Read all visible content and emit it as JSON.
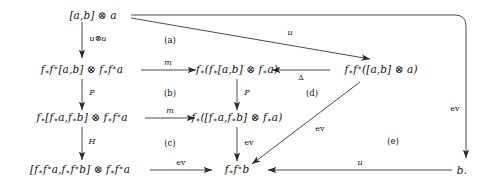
{
  "diagram": {
    "nodes": [
      {
        "id": "n-top",
        "label": "[a,b] ⊗ a"
      },
      {
        "id": "n-r2-left",
        "label": "f∗f∗[a,b] ⊗ f∗f∗a"
      },
      {
        "id": "n-r2-mid",
        "label": "f∗(f∗[a,b] ⊗ f∗a)"
      },
      {
        "id": "n-r2-right",
        "label": "f∗f∗([a,b] ⊗ a)"
      },
      {
        "id": "n-r3-left",
        "label": "f∗[f∗a,f∗b] ⊗ f∗f∗a"
      },
      {
        "id": "n-r3-mid",
        "label": "f∗([f∗a,f∗b] ⊗ f∗a)"
      },
      {
        "id": "n-r4-left",
        "label": "[f∗f∗a,f∗f∗b] ⊗ f∗f∗a"
      },
      {
        "id": "n-r4-mid",
        "label": "f∗f∗b"
      },
      {
        "id": "n-r4-right",
        "label": "b."
      }
    ],
    "arrow_labels": [
      {
        "id": "lbl-uou",
        "text": "u⊗u"
      },
      {
        "id": "lbl-u-diag",
        "text": "u"
      },
      {
        "id": "lbl-m-r2",
        "text": "m"
      },
      {
        "id": "lbl-delta",
        "text": "Δ"
      },
      {
        "id": "lbl-p-left",
        "text": "P"
      },
      {
        "id": "lbl-p-mid",
        "text": "P"
      },
      {
        "id": "lbl-m-r3",
        "text": "m"
      },
      {
        "id": "lbl-h",
        "text": "H"
      },
      {
        "id": "lbl-ev-mid",
        "text": "ev"
      },
      {
        "id": "lbl-ev-diag",
        "text": "ev"
      },
      {
        "id": "lbl-ev-bot",
        "text": "ev"
      },
      {
        "id": "lbl-ev-right",
        "text": "ev"
      },
      {
        "id": "lbl-u-bot",
        "text": "u"
      }
    ],
    "region_labels": [
      {
        "id": "reg-a",
        "text": "(a)"
      },
      {
        "id": "reg-b",
        "text": "(b)"
      },
      {
        "id": "reg-c",
        "text": "(c)"
      },
      {
        "id": "reg-d",
        "text": "(d)"
      },
      {
        "id": "reg-e",
        "text": "(e)"
      }
    ],
    "colors": {
      "background": "#ffffff",
      "ink": "#111111",
      "edge": "#2b2b2b"
    }
  }
}
